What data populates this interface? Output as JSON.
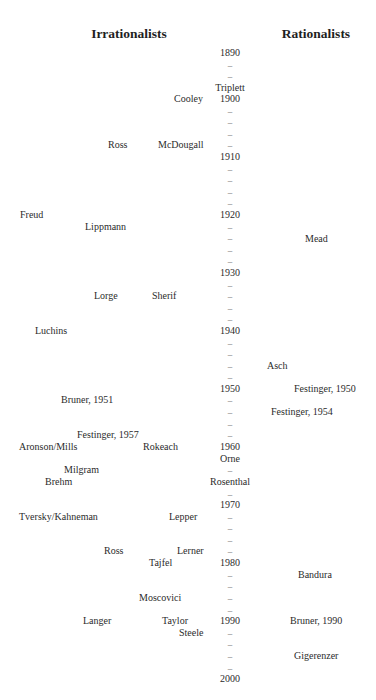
{
  "headings": {
    "left": "Irrationalists",
    "right": "Rationalists"
  },
  "timeline": {
    "x_center": 230,
    "rows": [
      {
        "label": "1890",
        "y": 53,
        "type": "year"
      },
      {
        "label": "–",
        "y": 65,
        "type": "dash"
      },
      {
        "label": "–",
        "y": 76,
        "type": "dash"
      },
      {
        "label": "Triplett",
        "y": 88,
        "type": "name"
      },
      {
        "label": "1900",
        "y": 99,
        "type": "year"
      },
      {
        "label": "–",
        "y": 111,
        "type": "dash"
      },
      {
        "label": "–",
        "y": 122,
        "type": "dash"
      },
      {
        "label": "–",
        "y": 134,
        "type": "dash"
      },
      {
        "label": "–",
        "y": 145,
        "type": "dash"
      },
      {
        "label": "1910",
        "y": 157,
        "type": "year"
      },
      {
        "label": "–",
        "y": 169,
        "type": "dash"
      },
      {
        "label": "–",
        "y": 180,
        "type": "dash"
      },
      {
        "label": "–",
        "y": 192,
        "type": "dash"
      },
      {
        "label": "–",
        "y": 203,
        "type": "dash"
      },
      {
        "label": "1920",
        "y": 215,
        "type": "year"
      },
      {
        "label": "–",
        "y": 227,
        "type": "dash"
      },
      {
        "label": "–",
        "y": 238,
        "type": "dash"
      },
      {
        "label": "–",
        "y": 250,
        "type": "dash"
      },
      {
        "label": "–",
        "y": 261,
        "type": "dash"
      },
      {
        "label": "1930",
        "y": 273,
        "type": "year"
      },
      {
        "label": "–",
        "y": 285,
        "type": "dash"
      },
      {
        "label": "–",
        "y": 296,
        "type": "dash"
      },
      {
        "label": "–",
        "y": 308,
        "type": "dash"
      },
      {
        "label": "–",
        "y": 319,
        "type": "dash"
      },
      {
        "label": "1940",
        "y": 331,
        "type": "year"
      },
      {
        "label": "–",
        "y": 343,
        "type": "dash"
      },
      {
        "label": "–",
        "y": 354,
        "type": "dash"
      },
      {
        "label": "–",
        "y": 366,
        "type": "dash"
      },
      {
        "label": "–",
        "y": 377,
        "type": "dash"
      },
      {
        "label": "1950",
        "y": 389,
        "type": "year"
      },
      {
        "label": "–",
        "y": 400,
        "type": "dash"
      },
      {
        "label": "–",
        "y": 412,
        "type": "dash"
      },
      {
        "label": "–",
        "y": 424,
        "type": "dash"
      },
      {
        "label": "–",
        "y": 435,
        "type": "dash"
      },
      {
        "label": "1960",
        "y": 447,
        "type": "year"
      },
      {
        "label": "Orne",
        "y": 459,
        "type": "name"
      },
      {
        "label": "–",
        "y": 470,
        "type": "dash"
      },
      {
        "label": "Rosenthal",
        "y": 482,
        "type": "name"
      },
      {
        "label": "–",
        "y": 494,
        "type": "dash"
      },
      {
        "label": "1970",
        "y": 505,
        "type": "year"
      },
      {
        "label": "–",
        "y": 517,
        "type": "dash"
      },
      {
        "label": "–",
        "y": 528,
        "type": "dash"
      },
      {
        "label": "–",
        "y": 540,
        "type": "dash"
      },
      {
        "label": "–",
        "y": 551,
        "type": "dash"
      },
      {
        "label": "1980",
        "y": 563,
        "type": "year"
      },
      {
        "label": "–",
        "y": 575,
        "type": "dash"
      },
      {
        "label": "–",
        "y": 586,
        "type": "dash"
      },
      {
        "label": "–",
        "y": 598,
        "type": "dash"
      },
      {
        "label": "–",
        "y": 610,
        "type": "dash"
      },
      {
        "label": "1990",
        "y": 621,
        "type": "year"
      },
      {
        "label": "–",
        "y": 633,
        "type": "dash"
      },
      {
        "label": "–",
        "y": 644,
        "type": "dash"
      },
      {
        "label": "–",
        "y": 656,
        "type": "dash"
      },
      {
        "label": "–",
        "y": 668,
        "type": "dash"
      },
      {
        "label": "2000",
        "y": 679,
        "type": "year"
      }
    ]
  },
  "irrationalists": [
    {
      "label": "Cooley",
      "x": 174,
      "y": 99
    },
    {
      "label": "Ross",
      "x": 108,
      "y": 145
    },
    {
      "label": "McDougall",
      "x": 158,
      "y": 145
    },
    {
      "label": "Freud",
      "x": 20,
      "y": 215
    },
    {
      "label": "Lippmann",
      "x": 85,
      "y": 227
    },
    {
      "label": "Lorge",
      "x": 94,
      "y": 296
    },
    {
      "label": "Sherif",
      "x": 152,
      "y": 296
    },
    {
      "label": "Luchins",
      "x": 35,
      "y": 331
    },
    {
      "label": "Bruner, 1951",
      "x": 61,
      "y": 400
    },
    {
      "label": "Festinger, 1957",
      "x": 77,
      "y": 435
    },
    {
      "label": "Aronson/Mills",
      "x": 19,
      "y": 447
    },
    {
      "label": "Rokeach",
      "x": 143,
      "y": 447
    },
    {
      "label": "Milgram",
      "x": 64,
      "y": 470
    },
    {
      "label": "Brehm",
      "x": 45,
      "y": 482
    },
    {
      "label": "Tversky/Kahneman",
      "x": 19,
      "y": 517
    },
    {
      "label": "Lepper",
      "x": 169,
      "y": 517
    },
    {
      "label": "Ross",
      "x": 104,
      "y": 551
    },
    {
      "label": "Lerner",
      "x": 177,
      "y": 551
    },
    {
      "label": "Tajfel",
      "x": 149,
      "y": 563
    },
    {
      "label": "Moscovici",
      "x": 139,
      "y": 598
    },
    {
      "label": "Langer",
      "x": 83,
      "y": 621
    },
    {
      "label": "Taylor",
      "x": 162,
      "y": 621
    },
    {
      "label": "Steele",
      "x": 179,
      "y": 633
    }
  ],
  "rationalists": [
    {
      "label": "Mead",
      "x": 305,
      "y": 239
    },
    {
      "label": "Asch",
      "x": 267,
      "y": 366
    },
    {
      "label": "Festinger, 1950",
      "x": 294,
      "y": 389
    },
    {
      "label": "Festinger, 1954",
      "x": 271,
      "y": 412
    },
    {
      "label": "Bandura",
      "x": 298,
      "y": 575
    },
    {
      "label": "Bruner, 1990",
      "x": 290,
      "y": 621
    },
    {
      "label": "Gigerenzer",
      "x": 294,
      "y": 656
    }
  ]
}
